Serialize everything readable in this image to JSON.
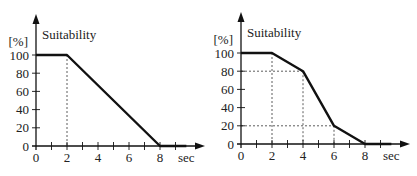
{
  "chart_data": [
    {
      "type": "line",
      "title": "Suitability",
      "xlabel": "sec",
      "ylabel": "[%]",
      "x": [
        0,
        2,
        8,
        9.7
      ],
      "values": [
        100,
        100,
        0,
        0
      ],
      "xticks": [
        0,
        2,
        4,
        6,
        8
      ],
      "yticks": [
        0,
        20,
        40,
        60,
        80,
        100
      ],
      "xlim": [
        0,
        10
      ],
      "ylim": [
        0,
        100
      ],
      "guides": [
        {
          "x": 2,
          "y": 100
        }
      ],
      "grid": false,
      "legend": null
    },
    {
      "type": "line",
      "title": "Suitability",
      "xlabel": "sec",
      "ylabel": "[%]",
      "x": [
        0,
        2,
        4,
        6,
        8,
        9.7
      ],
      "values": [
        100,
        100,
        80,
        20,
        0,
        0
      ],
      "xticks": [
        0,
        2,
        4,
        6,
        8
      ],
      "yticks": [
        0,
        20,
        40,
        60,
        80,
        100
      ],
      "xlim": [
        0,
        10
      ],
      "ylim": [
        0,
        100
      ],
      "guides": [
        {
          "x": 2,
          "y": 100
        },
        {
          "x": 4,
          "y": 80
        },
        {
          "x": 6,
          "y": 20
        }
      ],
      "grid": false,
      "legend": null
    }
  ],
  "labels": {
    "title": "Suitability",
    "ylabel": "[%]",
    "xlabel": "sec",
    "xticks": [
      "0",
      "2",
      "4",
      "6",
      "8"
    ],
    "yticks": [
      "0",
      "20",
      "40",
      "60",
      "80",
      "100"
    ]
  },
  "colors": {
    "line": "#111111",
    "axis": "#111111",
    "guide": "#333333"
  }
}
